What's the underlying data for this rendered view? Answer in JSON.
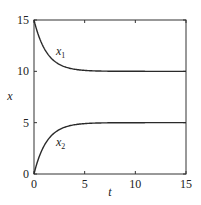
{
  "chart_data": {
    "type": "line",
    "title": "",
    "xlabel": "t",
    "ylabel": "x",
    "xlim": [
      0,
      15
    ],
    "ylim": [
      0,
      15
    ],
    "xticks": [
      0,
      5,
      10,
      15
    ],
    "yticks": [
      0,
      5,
      10,
      15
    ],
    "grid": false,
    "legend": "inline labels",
    "series": [
      {
        "name": "x1",
        "label_main": "x",
        "label_sub": "1",
        "x": [
          0,
          0.5,
          1,
          1.5,
          2,
          2.5,
          3,
          4,
          5,
          6,
          8,
          10,
          12,
          15
        ],
        "values": [
          15,
          13.35,
          12.25,
          11.51,
          11.01,
          10.68,
          10.45,
          10.2,
          10.09,
          10.04,
          10.01,
          10.0,
          10.0,
          10.0
        ]
      },
      {
        "name": "x2",
        "label_main": "x",
        "label_sub": "2",
        "x": [
          0,
          0.5,
          1,
          1.5,
          2,
          2.5,
          3,
          4,
          5,
          6,
          8,
          10,
          12,
          15
        ],
        "values": [
          0,
          1.65,
          2.75,
          3.49,
          3.99,
          4.32,
          4.55,
          4.8,
          4.91,
          4.96,
          4.99,
          5.0,
          5.0,
          5.0
        ]
      }
    ]
  },
  "color": {
    "line": "#2a2a2a",
    "axis": "#333333"
  }
}
